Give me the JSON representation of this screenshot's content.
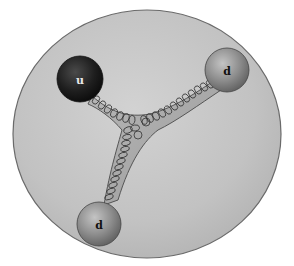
{
  "diagram": {
    "title": "",
    "particle_boundary": {
      "shape": "ellipse",
      "fill": "#c4c4c4",
      "stroke": "#6a6a6a"
    },
    "quarks": [
      {
        "label": "u",
        "cx": 80,
        "cy": 79,
        "r": 23,
        "color": "#1e1e1e",
        "label_color": "#e8e8e8"
      },
      {
        "label": "d",
        "cx": 227,
        "cy": 70,
        "r": 22,
        "color": "#8c8c8c",
        "label_color": "#111111"
      },
      {
        "label": "d",
        "cx": 99,
        "cy": 224,
        "r": 22,
        "color": "#8c8c8c",
        "label_color": "#111111"
      }
    ],
    "junction": {
      "x": 140,
      "y": 130
    },
    "connector_type": "gluon-spring",
    "gluon_color": "#333333"
  }
}
